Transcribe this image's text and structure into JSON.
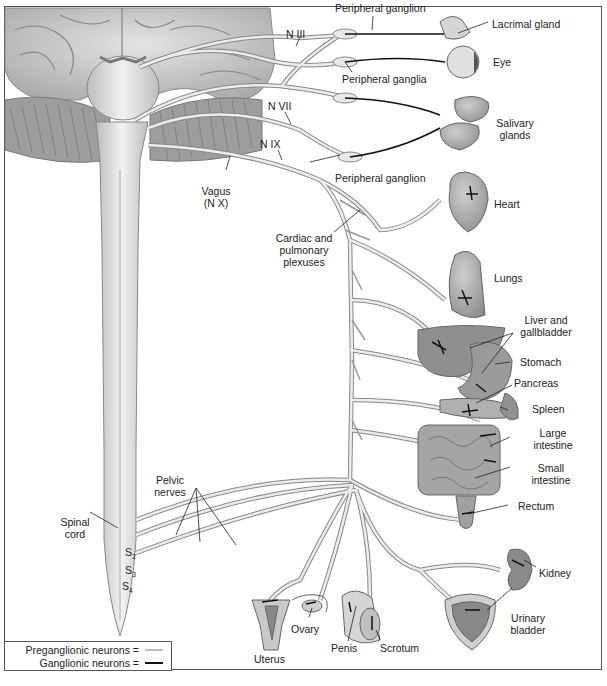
{
  "diagram": {
    "type": "anatomical illustration",
    "palette": {
      "background": "#ffffff",
      "ink": "#222222",
      "border": "#555555",
      "organ_fill": "#a8a8a8",
      "nerve_fill": "#e6e6e6",
      "ganglionic_line": "#111111"
    }
  },
  "labels": {
    "peripheral_ganglion_top": "Peripheral ganglion",
    "lacrimal_gland": "Lacrimal gland",
    "n3": "N III",
    "eye": "Eye",
    "peripheral_ganglia": "Peripheral ganglia",
    "n7": "N VII",
    "salivary_1": "Salivary",
    "salivary_2": "glands",
    "n9": "N IX",
    "peripheral_ganglion_bottom": "Peripheral ganglion",
    "heart": "Heart",
    "vagus_1": "Vagus",
    "vagus_2": "(N X)",
    "cardiac_1": "Cardiac and",
    "cardiac_2": "pulmonary",
    "cardiac_3": "plexuses",
    "lungs": "Lungs",
    "liver_1": "Liver and",
    "liver_2": "gallbladder",
    "stomach": "Stomach",
    "pancreas": "Pancreas",
    "spleen": "Spleen",
    "large_int_1": "Large",
    "large_int_2": "intestine",
    "small_int_1": "Small",
    "small_int_2": "intestine",
    "rectum": "Rectum",
    "pelvic_1": "Pelvic",
    "pelvic_2": "nerves",
    "spinal_1": "Spinal",
    "spinal_2": "cord",
    "s2": "S",
    "s2_sub": "2",
    "s3": "S",
    "s3_sub": "3",
    "s4": "S",
    "s4_sub": "4",
    "kidney": "Kidney",
    "ovary": "Ovary",
    "urinary_1": "Urinary",
    "urinary_2": "bladder",
    "uterus": "Uterus",
    "penis": "Penis",
    "scrotum": "Scrotum"
  },
  "legend": {
    "items": [
      {
        "label": "Preganglionic neurons =",
        "swatch": "#bdbdbd"
      },
      {
        "label": "Ganglionic neurons =",
        "swatch": "#111111"
      }
    ]
  }
}
